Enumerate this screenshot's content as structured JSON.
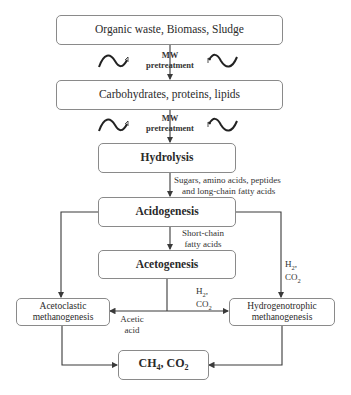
{
  "diagram": {
    "type": "flowchart",
    "nodes": {
      "feedstock": "Organic waste, Biomass, Sludge",
      "macromolecules": "Carbohydrates, proteins, lipids",
      "hydrolysis": "Hydrolysis",
      "acidogenesis": "Acidogenesis",
      "acetogenesis": "Acetogenesis",
      "acetoclastic": [
        "Acetoclastic",
        "methanogenesis"
      ],
      "hydrogenotrophic": [
        "Hydrogenotrophic",
        "methanogenesis"
      ],
      "products": {
        "ch": "CH",
        "ch_sub": "4",
        "co": ", CO",
        "co_sub": "2"
      }
    },
    "edge_labels": {
      "pretreatment_1": [
        "MW",
        "pretreatment"
      ],
      "pretreatment_2": [
        "MW",
        "pretreatment"
      ],
      "hydrolysis_products": [
        "Sugars, amino acids, peptides",
        "and long-chain fatty acids"
      ],
      "short_chain": [
        "Short-chain",
        "fatty acids"
      ],
      "h2_co2_right": {
        "h": "H",
        "h_sub": "2",
        "h_tail": ",",
        "co": "CO",
        "co_sub": "2"
      },
      "h2_co2_mid": {
        "h": "H",
        "h_sub": "2",
        "h_tail": ",",
        "co": "CO",
        "co_sub": "2"
      },
      "acetic_acid": [
        "Acetic",
        "acid"
      ]
    },
    "icons": [
      "microwave-wave-icon",
      "microwave-wave-icon",
      "microwave-wave-icon",
      "microwave-wave-icon"
    ],
    "colors": {
      "line": "#3a3a3a",
      "box_border": "#8a8a8a",
      "text": "#2a2a2a"
    }
  }
}
